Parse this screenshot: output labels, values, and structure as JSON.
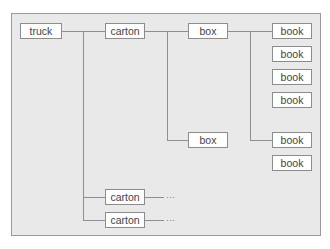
{
  "diagram": {
    "type": "containment-hierarchy",
    "nodes": {
      "truck": "truck",
      "carton_1": "carton",
      "carton_2": "carton",
      "carton_3": "carton",
      "box_1": "box",
      "box_2": "box",
      "book_1": "book",
      "book_2": "book",
      "book_3": "book",
      "book_4": "book",
      "book_5": "book",
      "book_6": "book"
    },
    "ellipsis_1": "···",
    "ellipsis_2": "···",
    "colors": {
      "background": "#e9e9e9",
      "node_fill": "#ffffff",
      "line": "#8f8f8f",
      "text": "#444444"
    }
  }
}
